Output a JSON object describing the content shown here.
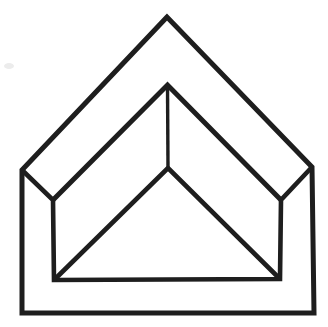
{
  "canvas": {
    "width": 328,
    "height": 327,
    "background": "#ffffff"
  },
  "figure": {
    "stroke_color": "#1e1e1e",
    "points": {
      "apex_outer": [
        167,
        17
      ],
      "corner_left_outer": [
        22,
        170
      ],
      "corner_right_outer": [
        312,
        167
      ],
      "base_left_outer": [
        22,
        313
      ],
      "base_right_outer": [
        314,
        313
      ],
      "corner_left_inner": [
        53,
        200
      ],
      "corner_right_inner": [
        281,
        200
      ],
      "apex_inner": [
        167.5,
        85
      ],
      "apex_lower": [
        168,
        168
      ],
      "base_left_inner": [
        54,
        280
      ],
      "base_right_inner": [
        280,
        279
      ]
    },
    "polylines": [
      {
        "name": "outer-outline",
        "points": [
          "apex_outer",
          "corner_left_outer",
          "base_left_outer",
          "base_right_outer",
          "corner_right_outer"
        ],
        "closed": true,
        "width": 5
      },
      {
        "name": "inner-frame",
        "points": [
          "corner_left_outer",
          "corner_left_inner",
          "base_left_inner",
          "base_right_inner",
          "corner_right_inner",
          "corner_right_outer"
        ],
        "closed": false,
        "width": 4.6
      },
      {
        "name": "inner-roof-chevron",
        "points": [
          "corner_left_inner",
          "apex_inner",
          "corner_right_inner"
        ],
        "closed": false,
        "width": 5
      },
      {
        "name": "ridge-line",
        "points": [
          "apex_inner",
          "apex_lower"
        ],
        "closed": false,
        "width": 3.4
      },
      {
        "name": "lower-chevron",
        "points": [
          "base_left_inner",
          "apex_lower",
          "base_right_inner"
        ],
        "closed": false,
        "width": 4.6
      }
    ],
    "artifact": {
      "name": "paper-speck",
      "x": 9,
      "y": 66,
      "rx": 5,
      "ry": 3,
      "color": "#ececec"
    }
  }
}
